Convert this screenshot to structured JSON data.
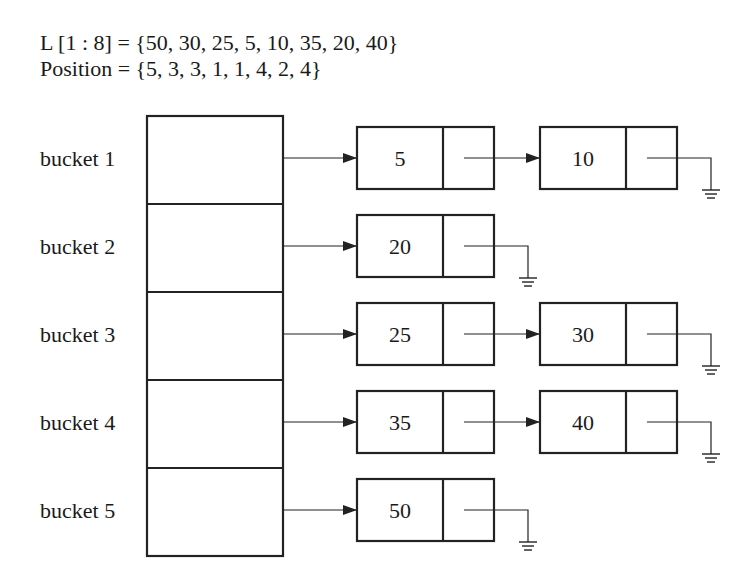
{
  "header": {
    "list_definition": "L [1 : 8] = {50, 30, 25, 5, 10, 35, 20, 40}",
    "position_definition": "Position = {5, 3, 3, 1, 1, 4, 2, 4}"
  },
  "buckets": [
    {
      "label": "bucket 1",
      "nodes": [
        "5",
        "10"
      ]
    },
    {
      "label": "bucket 2",
      "nodes": [
        "20"
      ]
    },
    {
      "label": "bucket 3",
      "nodes": [
        "25",
        "30"
      ]
    },
    {
      "label": "bucket 4",
      "nodes": [
        "35",
        "40"
      ]
    },
    {
      "label": "bucket 5",
      "nodes": [
        "50"
      ]
    }
  ],
  "colors": {
    "stroke": "#222222",
    "background": "#ffffff"
  },
  "icons": {
    "null_terminator": "ground-symbol-icon",
    "pointer": "arrow-right-icon"
  }
}
